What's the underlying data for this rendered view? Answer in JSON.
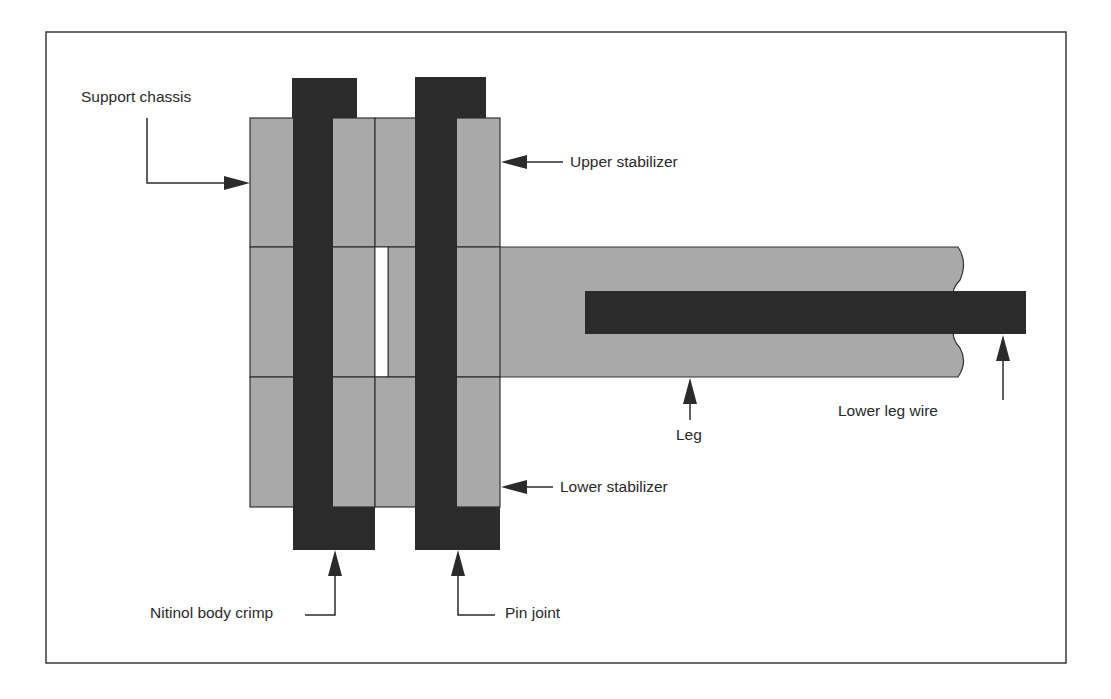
{
  "diagram": {
    "colors": {
      "frame": "#3a3a3a",
      "light_part": "#a9a9a9",
      "dark_part": "#2b2b2b",
      "outline": "#333333",
      "background": "#ffffff"
    },
    "labels": {
      "support_chassis": "Support chassis",
      "upper_stabilizer": "Upper stabilizer",
      "lower_stabilizer": "Lower stabilizer",
      "leg": "Leg",
      "lower_leg_wire": "Lower leg wire",
      "nitinol_body_crimp": "Nitinol body crimp",
      "pin_joint": "Pin joint"
    }
  }
}
